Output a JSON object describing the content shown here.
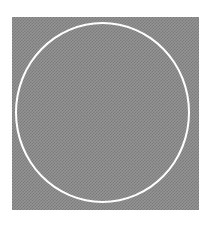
{
  "image": {
    "description": "Gray dithered checker-pattern square with a thin white circle outline inscribed",
    "background_color": "#ffffff",
    "square": {
      "fill_pattern": "checker",
      "dark_color": "#6f6f6f",
      "light_color": "#a8a8a8"
    },
    "circle": {
      "stroke_color": "#ffffff",
      "stroke_width_px": 2
    }
  }
}
